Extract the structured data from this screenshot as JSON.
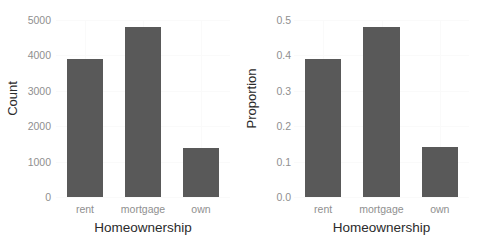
{
  "chart_data": [
    {
      "type": "bar",
      "title": "",
      "xlabel": "Homeownership",
      "ylabel": "Count",
      "categories": [
        "rent",
        "mortgage",
        "own"
      ],
      "values": [
        3900,
        4800,
        1380
      ],
      "ylim": [
        0,
        5000
      ],
      "yticks": [
        0,
        1000,
        2000,
        3000,
        4000,
        5000
      ],
      "ytick_labels": [
        "0",
        "1000",
        "2000",
        "3000",
        "4000",
        "5000"
      ],
      "grid": true,
      "legend": "none",
      "bar_color": "#595959"
    },
    {
      "type": "bar",
      "title": "",
      "xlabel": "Homeownership",
      "ylabel": "Proportion",
      "categories": [
        "rent",
        "mortgage",
        "own"
      ],
      "values": [
        0.39,
        0.48,
        0.14
      ],
      "ylim": [
        0,
        0.5
      ],
      "yticks": [
        0.0,
        0.1,
        0.2,
        0.3,
        0.4,
        0.5
      ],
      "ytick_labels": [
        "0.0",
        "0.1",
        "0.2",
        "0.3",
        "0.4",
        "0.5"
      ],
      "grid": true,
      "legend": "none",
      "bar_color": "#595959"
    }
  ],
  "colors": {
    "bar": "#595959",
    "gridline": "#fafafa",
    "tick_text": "#8f8f8f",
    "axis_title": "#2b2b2b",
    "background": "#ffffff"
  }
}
